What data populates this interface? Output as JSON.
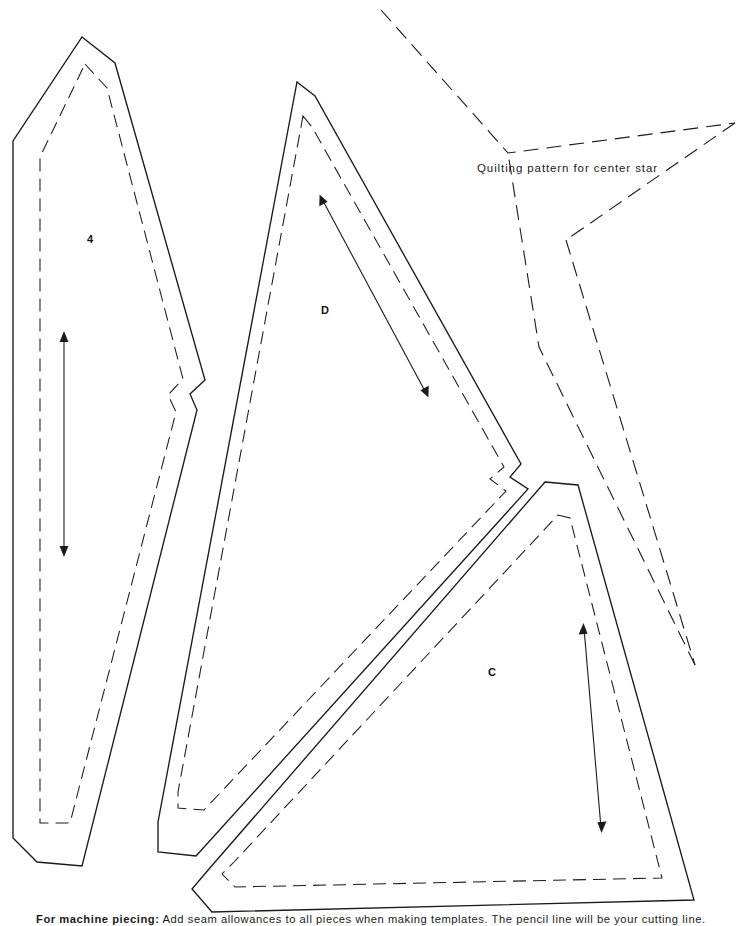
{
  "page": {
    "width": 740,
    "height": 926,
    "background": "#ffffff",
    "ink_color": "#1a1a1a"
  },
  "star": {
    "caption": "Quilting pattern for center star",
    "caption_x": 477,
    "caption_y": 168,
    "line_style": "dashed",
    "outline_points": "381,10 508,153 735,123 566,240 695,665 539,347 508,153"
  },
  "footer": {
    "lead": "For machine piecing:",
    "text": " Add seam allowances to all pieces when making templates. The pencil line will be your cutting line."
  },
  "pieces": [
    {
      "id": "piece-4",
      "label": "4",
      "label_x": 90,
      "label_y": 240,
      "cut_outline": "82,37 115,63 205,380 190,394 197,410 82,866 37,862 13,838 13,141",
      "seam_outline": "85,64 107,88 183,379 168,395 176,412 70,823 40,823 40,157",
      "grain_arrow": {
        "x1": 64,
        "y1": 336,
        "x2": 64,
        "y2": 552,
        "heads": "both"
      }
    },
    {
      "id": "piece-D",
      "label": "D",
      "label_x": 325,
      "label_y": 311,
      "cut_outline": "297,82 315,96 521,464 510,477 528,489 196,856 158,852 158,822",
      "seam_outline": "303,116 312,127 504,467 490,479 506,491 204,810 178,808 178,792",
      "grain_arrow": {
        "x1": 322,
        "y1": 199,
        "x2": 426,
        "y2": 393,
        "heads": "both"
      }
    },
    {
      "id": "piece-C",
      "label": "C",
      "label_x": 492,
      "label_y": 673,
      "cut_outline": "545,482 578,485 694,900 212,912 192,889 209,869",
      "seam_outline": "558,515 570,518 662,878 235,887 222,874 234,862",
      "grain_arrow": {
        "x1": 584,
        "y1": 628,
        "x2": 601,
        "y2": 828,
        "heads": "both"
      }
    }
  ]
}
